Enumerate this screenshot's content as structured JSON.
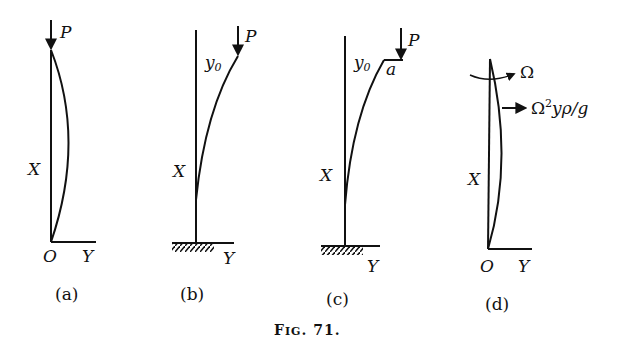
{
  "figure": {
    "caption_prefix": "F",
    "caption_small": "IG",
    "caption_number": ". 71."
  },
  "panels": [
    {
      "id": "a",
      "label": "(a)",
      "load": "P",
      "axis_x": "X",
      "axis_y": "Y",
      "origin": "O"
    },
    {
      "id": "b",
      "label": "(b)",
      "load": "P",
      "axis_x": "X",
      "axis_y": "Y",
      "deflection": "y",
      "deflection_sub": "0"
    },
    {
      "id": "c",
      "label": "(c)",
      "load": "P",
      "axis_x": "X",
      "axis_y": "Y",
      "deflection": "y",
      "deflection_sub": "0",
      "offset": "a"
    },
    {
      "id": "d",
      "label": "(d)",
      "rotation": "Ω",
      "force_base": "Ω",
      "force_sup": "2",
      "force_rest": "yρ/g",
      "axis_x": "X",
      "axis_y": "Y",
      "origin": "O"
    }
  ]
}
